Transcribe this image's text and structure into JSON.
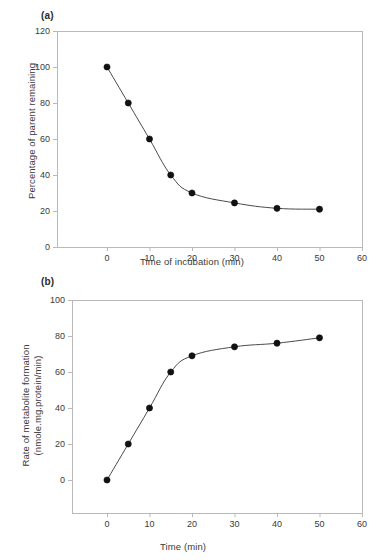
{
  "figure": {
    "panels": [
      {
        "tag": "(a)",
        "x_axis_label": "Time of incubation (min)",
        "y_axis_label": "Percentage of parent remaining"
      },
      {
        "tag": "(b)",
        "x_axis_label": "Time (min)",
        "y_axis_label_line1": "Rate of metabolite formation",
        "y_axis_label_line2": "(nmole.mg.protein/min)"
      }
    ],
    "style": {
      "axis_color": "#b9b9b9",
      "line_color": "#4a4a4a",
      "marker_color": "#111111",
      "text_color": "#3a3a3a"
    }
  },
  "chart_data": [
    {
      "type": "line",
      "panel": "(a)",
      "title": "",
      "xlabel": "Time of incubation (min)",
      "ylabel": "Percentage of parent remaining",
      "xlim": [
        0,
        60
      ],
      "ylim": [
        0,
        120
      ],
      "xticks": [
        0,
        10,
        20,
        30,
        40,
        50,
        60
      ],
      "yticks": [
        0,
        20,
        40,
        60,
        80,
        100,
        120
      ],
      "grid": false,
      "legend": "none",
      "markers": "filled-circle",
      "series": [
        {
          "name": "Percentage of parent remaining",
          "x": [
            0,
            5,
            10,
            15,
            20,
            30,
            40,
            50
          ],
          "values": [
            100,
            80,
            60,
            40,
            30,
            24.5,
            21.5,
            21
          ]
        }
      ]
    },
    {
      "type": "line",
      "panel": "(b)",
      "title": "",
      "xlabel": "Time (min)",
      "ylabel": "Rate of metabolite formation (nmole.mg.protein/min)",
      "xlim": [
        0,
        60
      ],
      "ylim": [
        0,
        100
      ],
      "xticks": [
        0,
        10,
        20,
        30,
        40,
        50,
        60
      ],
      "yticks": [
        0,
        20,
        40,
        60,
        80,
        100
      ],
      "grid": false,
      "legend": "none",
      "markers": "filled-circle",
      "series": [
        {
          "name": "Rate of metabolite formation",
          "x": [
            0,
            5,
            10,
            15,
            20,
            30,
            40,
            50
          ],
          "values": [
            0,
            20,
            40,
            60,
            69,
            74,
            76,
            79
          ]
        }
      ]
    }
  ],
  "tick_labels": {
    "panel_a_x": [
      "0",
      "10",
      "20",
      "30",
      "40",
      "50",
      "60"
    ],
    "panel_a_y": [
      "0",
      "20",
      "40",
      "60",
      "80",
      "100",
      "120"
    ],
    "panel_b_x": [
      "0",
      "10",
      "20",
      "30",
      "40",
      "50",
      "60"
    ],
    "panel_b_y": [
      "0",
      "20",
      "40",
      "60",
      "80",
      "100"
    ]
  }
}
